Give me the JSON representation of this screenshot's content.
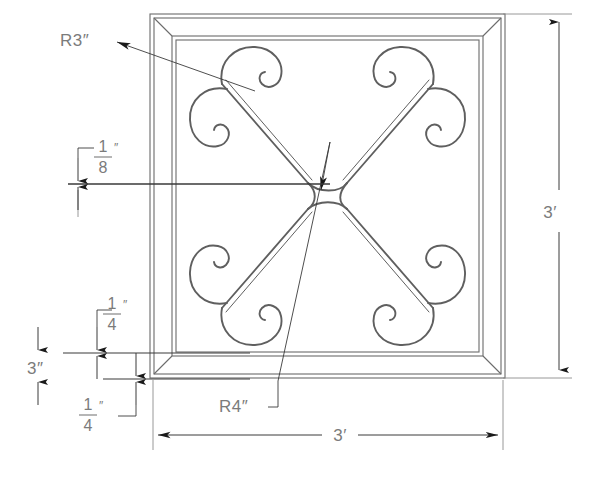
{
  "drawing": {
    "title": "Decorative Wrought Iron Panel Detail",
    "type": "cad-technical-drawing",
    "background_color": "#ffffff",
    "line_color": "#6b6b6b",
    "dimension_color": "#7b7b7b",
    "arrow_color": "#1a1a1a"
  },
  "labels": {
    "radius_scroll": "R3″",
    "radius_center": "R4″",
    "height_overall": "3′",
    "width_overall": "3′",
    "frame_width": "3″"
  },
  "fractions": {
    "bar_thickness": {
      "numerator": "1",
      "denominator": "8",
      "unit": "″"
    },
    "rail_offset_top": {
      "numerator": "1",
      "denominator": "4",
      "unit": "″"
    },
    "rail_offset_bottom": {
      "numerator": "1",
      "denominator": "4",
      "unit": "″"
    }
  },
  "dimensions": [
    {
      "name": "overall-height",
      "value": "3′",
      "orientation": "vertical",
      "side": "right"
    },
    {
      "name": "overall-width",
      "value": "3′",
      "orientation": "horizontal",
      "side": "bottom"
    },
    {
      "name": "frame-member-width",
      "value": "3″",
      "orientation": "vertical",
      "side": "left"
    },
    {
      "name": "scroll-radius",
      "value": "R3″",
      "orientation": "leader",
      "side": "upper-left"
    },
    {
      "name": "center-radius",
      "value": "R4″",
      "orientation": "leader",
      "side": "lower-center"
    },
    {
      "name": "bar-thickness",
      "value": "1/8″",
      "orientation": "vertical",
      "side": "left"
    },
    {
      "name": "rail-gap-upper",
      "value": "1/4″",
      "orientation": "vertical",
      "side": "left"
    },
    {
      "name": "rail-gap-lower",
      "value": "1/4″",
      "orientation": "vertical",
      "side": "left"
    }
  ]
}
